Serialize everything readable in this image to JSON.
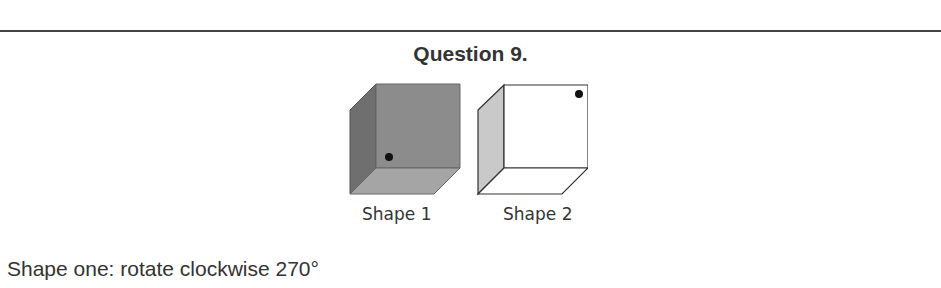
{
  "question": {
    "title": "Question 9.",
    "shapes": [
      {
        "label": "Shape 1",
        "fill": "#8a8a8a",
        "dot": "lower-left of front face"
      },
      {
        "label": "Shape 2",
        "fill": "#ffffff",
        "dot": "upper-right of front face"
      }
    ],
    "instruction": "Shape one: rotate clockwise 270°"
  }
}
